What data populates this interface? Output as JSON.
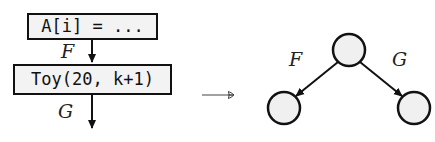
{
  "left_flow": {
    "statements": [
      {
        "code": "A[i] = ..."
      },
      {
        "code": "Toy(20, k+1)"
      }
    ],
    "edge_labels": [
      "F",
      "G"
    ]
  },
  "transform_arrow": "⟶",
  "right_graph": {
    "nodes": [
      {
        "id": "root",
        "cx": 349,
        "cy": 50,
        "r": 16
      },
      {
        "id": "left",
        "cx": 284,
        "cy": 108,
        "r": 16
      },
      {
        "id": "right",
        "cx": 414,
        "cy": 108,
        "r": 16
      }
    ],
    "edges": [
      {
        "from": "root",
        "to": "left",
        "label": "F"
      },
      {
        "from": "root",
        "to": "right",
        "label": "G"
      }
    ]
  },
  "colors": {
    "stroke": "#111111",
    "node_fill": "#f0f0f0",
    "box_fill": "#f3f3f3"
  }
}
